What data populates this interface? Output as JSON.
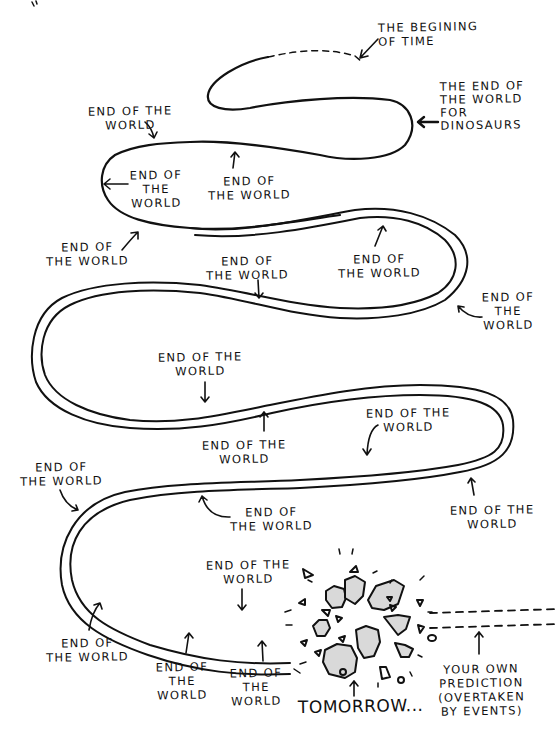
{
  "colors": {
    "ink": "#111111",
    "background": "#ffffff",
    "rock_fill": "#d9d9d9"
  },
  "diagram": {
    "title": "",
    "start_label": {
      "text": "THE BEGINING\nOF TIME"
    },
    "dinosaur_label": {
      "text": "THE END OF\nTHE WORLD\nFOR\nDINOSAURS"
    },
    "end_labels": [
      {
        "id": "e1",
        "text": "END OF THE\nWORLD"
      },
      {
        "id": "e2",
        "text": "END OF\nTHE\nWORLD"
      },
      {
        "id": "e3",
        "text": "END OF\nTHE WORLD"
      },
      {
        "id": "e4",
        "text": "END OF\nTHE WORLD"
      },
      {
        "id": "e5",
        "text": "END OF\nTHE WORLD"
      },
      {
        "id": "e6",
        "text": "END OF\nTHE WORLD"
      },
      {
        "id": "e7",
        "text": "END OF\nTHE\nWORLD"
      },
      {
        "id": "e8",
        "text": "END OF THE\nWORLD"
      },
      {
        "id": "e9",
        "text": "END OF THE\nWORLD"
      },
      {
        "id": "e10",
        "text": "END OF THE\nWORLD"
      },
      {
        "id": "e11",
        "text": "END OF\nTHE WORLD"
      },
      {
        "id": "e12",
        "text": "END OF\nTHE WORLD"
      },
      {
        "id": "e13",
        "text": "END OF THE\nWORLD"
      },
      {
        "id": "e14",
        "text": "END OF THE\nWORLD"
      },
      {
        "id": "e15",
        "text": "END OF\nTHE WORLD"
      },
      {
        "id": "e16",
        "text": "END OF\nTHE\nWORLD"
      },
      {
        "id": "e17",
        "text": "END OF\nTHE\nWORLD"
      }
    ],
    "tomorrow_label": {
      "text": "TOMORROW..."
    },
    "prediction_label": {
      "text": "YOUR OWN\nPREDICTION\n(OVERTAKEN\nBY EVENTS)"
    }
  }
}
